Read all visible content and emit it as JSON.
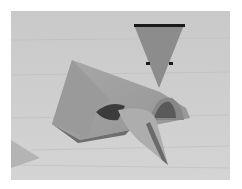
{
  "image": {
    "subject": "folded paper model on wooden surface",
    "annotation": {
      "type": "arrow",
      "shape": "downward-triangle",
      "fill": "#8c8c8c",
      "bar_color": "#1a1a1a"
    },
    "colors": {
      "border": "#ffffff",
      "background": "#c8c8c8",
      "paper": "#a0a0a0",
      "shadow": "#3a3a3a"
    }
  }
}
